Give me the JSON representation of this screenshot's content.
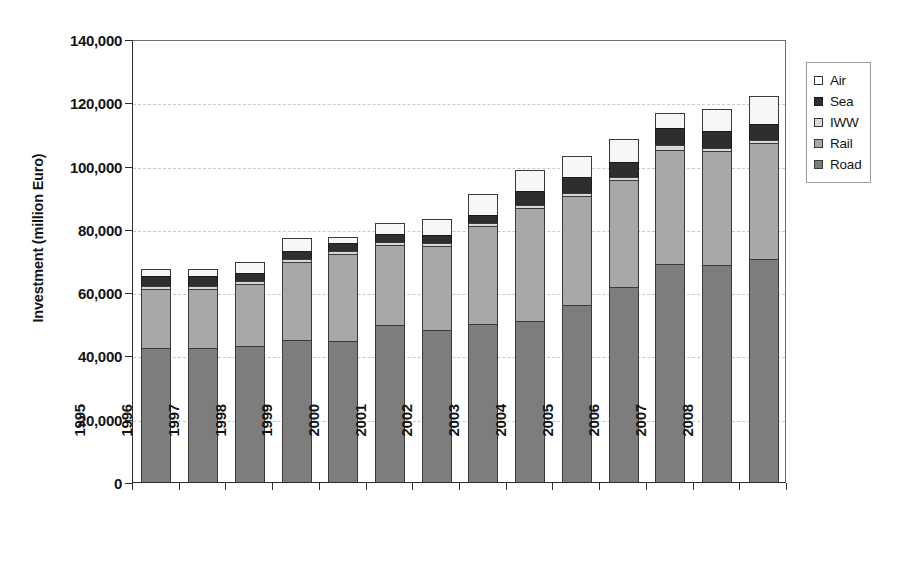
{
  "chart_data": {
    "type": "bar",
    "stacked": true,
    "title": "",
    "xlabel": "",
    "ylabel": "Investment (million Euro)",
    "ylim": [
      0,
      140000
    ],
    "ytick_labels": [
      "140,000",
      "120,000",
      "100,000",
      "80,000",
      "60,000",
      "40,000",
      "20,000",
      "0"
    ],
    "ytick_values": [
      140000,
      120000,
      100000,
      80000,
      60000,
      40000,
      20000,
      0
    ],
    "grid": true,
    "grid_axis": "y",
    "legend_position": "right",
    "categories": [
      "1995",
      "1996",
      "1997",
      "1998",
      "1999",
      "2000",
      "2001",
      "2002",
      "2003",
      "2004",
      "2005",
      "2006",
      "2007",
      "2008"
    ],
    "series": [
      {
        "name": "Road",
        "color": "#7d7d7d",
        "values": [
          42500,
          42500,
          43000,
          45000,
          44500,
          49500,
          48000,
          50000,
          51000,
          56000,
          61500,
          69000,
          68500,
          70500
        ]
      },
      {
        "name": "Rail",
        "color": "#a8a8a8",
        "values": [
          18500,
          18500,
          19500,
          24500,
          27500,
          25500,
          26500,
          31000,
          35500,
          34500,
          34000,
          36000,
          36000,
          36500
        ]
      },
      {
        "name": "IWW",
        "color": "#d8d8d8",
        "values": [
          1000,
          1000,
          1000,
          1000,
          1000,
          1000,
          1000,
          1000,
          1000,
          1000,
          1000,
          1500,
          1000,
          1000
        ]
      },
      {
        "name": "Sea",
        "color": "#2e2e2e",
        "values": [
          3000,
          3000,
          2500,
          2500,
          2500,
          2500,
          2500,
          2500,
          4500,
          5000,
          4500,
          5500,
          5500,
          5000
        ]
      },
      {
        "name": "Air",
        "color": "#f7f7f7",
        "values": [
          2400,
          2400,
          3500,
          4000,
          2000,
          3500,
          5000,
          6500,
          6500,
          6500,
          7500,
          4500,
          7000,
          9000
        ]
      }
    ],
    "totals": [
      67400,
      67400,
      69500,
      77000,
      77500,
      82000,
      83000,
      91000,
      98500,
      103000,
      108500,
      116500,
      118000,
      122000
    ],
    "legend": [
      "Air",
      "Sea",
      "IWW",
      "Rail",
      "Road"
    ]
  },
  "legend": {
    "items": [
      {
        "label": "Air",
        "swatch": "sw-air"
      },
      {
        "label": "Sea",
        "swatch": "sw-sea"
      },
      {
        "label": "IWW",
        "swatch": "sw-iww"
      },
      {
        "label": "Rail",
        "swatch": "sw-rail"
      },
      {
        "label": "Road",
        "swatch": "sw-road"
      }
    ]
  }
}
